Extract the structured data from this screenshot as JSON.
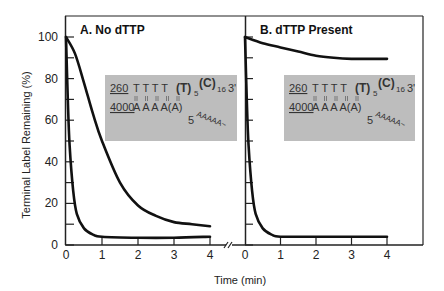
{
  "chart_data": {
    "type": "line",
    "ylabel": "Terminal Label Remaining (%)",
    "xlabel": "Time (min)",
    "ylim": [
      0,
      100
    ],
    "y_ticks_major": [
      0,
      20,
      40,
      60,
      80,
      100
    ],
    "y_ticks_minor_step": 10,
    "x_ticks": [
      0,
      1,
      2,
      3,
      4
    ],
    "axis_break": true,
    "grid": false,
    "panels": [
      {
        "title": "A. No dTTP",
        "xlim": [
          0,
          4
        ],
        "series": [
          {
            "name": "260",
            "x": [
              0,
              0.25,
              0.5,
              0.75,
              1,
              1.5,
              2,
              2.5,
              3,
              3.5,
              4
            ],
            "values": [
              100,
              92,
              78,
              63,
              50,
              30,
              19,
              14,
              11,
              10,
              9
            ]
          },
          {
            "name": "4000",
            "x": [
              0,
              0.05,
              0.1,
              0.2,
              0.3,
              0.5,
              0.75,
              1,
              2,
              3,
              4
            ],
            "values": [
              100,
              70,
              48,
              26,
              15,
              8,
              5,
              4,
              3.5,
              3.5,
              4
            ]
          }
        ],
        "inset": {
          "top_label": "260",
          "top_seq": "T T T T",
          "top_bold": "(T)",
          "top_sub1": "5",
          "top_bold2": "(C)",
          "top_sub2": "16",
          "top_end": "3'",
          "bottom_label": "4000",
          "bottom_seq": "A A A A(A)",
          "bottom_start": "5",
          "bottom_tail": "AAAAA~"
        }
      },
      {
        "title": "B. dTTP Present",
        "xlim": [
          0,
          4
        ],
        "series": [
          {
            "name": "260",
            "x": [
              0,
              0.5,
              1,
              1.5,
              2,
              2.5,
              3,
              3.5,
              4
            ],
            "values": [
              100,
              97,
              95,
              93,
              91,
              90,
              89.5,
              89.5,
              89.5
            ]
          },
          {
            "name": "4000",
            "x": [
              0,
              0.05,
              0.1,
              0.2,
              0.3,
              0.5,
              0.75,
              1,
              2,
              3,
              4
            ],
            "values": [
              100,
              70,
              48,
              26,
              15,
              8,
              5,
              4,
              4,
              4,
              4
            ]
          }
        ],
        "inset": {
          "top_label": "260",
          "top_seq": "T T T T",
          "top_bold": "(T)",
          "top_sub1": "5",
          "top_bold2": "(C)",
          "top_sub2": "16",
          "top_end": "3'",
          "bottom_label": "4000",
          "bottom_seq": "A A A A(A)",
          "bottom_start": "5",
          "bottom_tail": "AAAAA~"
        }
      }
    ]
  },
  "labels": {
    "ylabel": "Terminal Label Remaining (%)",
    "xlabel": "Time (min)",
    "panelA_title": "A. No dTTP",
    "panelB_title": "B. dTTP Present",
    "y_tick_labels": [
      "0",
      "20",
      "40",
      "60",
      "80",
      "100"
    ],
    "x_tick_labels": [
      "0",
      "1",
      "2",
      "3",
      "4"
    ]
  },
  "colors": {
    "line": "#111111",
    "frame": "#222222",
    "inset_bg": "#bdbdbd"
  }
}
